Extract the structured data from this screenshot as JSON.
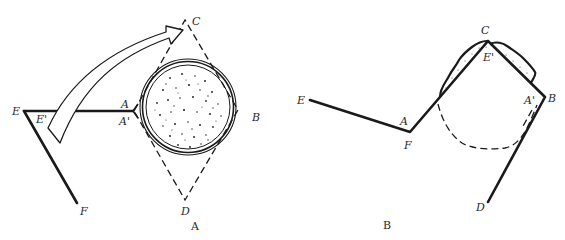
{
  "figure": {
    "panels": [
      {
        "id": "A",
        "caption": "A",
        "labels": {
          "E": "E",
          "E_prime": "E'",
          "A": "A",
          "A_prime": "A'",
          "B": "B",
          "C": "C",
          "D": "D",
          "F": "F"
        },
        "elements": [
          "solid line E–A",
          "solid line E–F",
          "dashed diamond A–C–B–D",
          "dotted circle with double ring inscribed in diamond",
          "curved hollow arrow from E' to C"
        ]
      },
      {
        "id": "B",
        "caption": "B",
        "labels": {
          "E": "E",
          "A": "A",
          "F": "F",
          "C": "C",
          "E_prime": "E'",
          "A_prime": "A'",
          "B": "B",
          "D": "D"
        },
        "elements": [
          "solid polyline E–F–C–B–D",
          "dotted cap segments along F–C and C–B",
          "dashed arc below C"
        ]
      }
    ],
    "colors": {
      "ink": "#1a1a1a",
      "background": "#ffffff"
    }
  }
}
